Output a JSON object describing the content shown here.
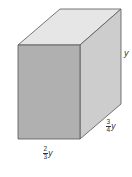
{
  "figure": {
    "type": "rectangular-prism",
    "colors": {
      "top_face": "#e6e6e6",
      "front_face": "#b0b0b0",
      "side_face": "#cdcdcd",
      "edge": "#555555"
    }
  },
  "labels": {
    "height": {
      "variable": "y"
    },
    "depth": {
      "numerator": "3",
      "denominator": "4",
      "variable": "y"
    },
    "width": {
      "numerator": "2",
      "denominator": "3",
      "variable": "y"
    }
  }
}
